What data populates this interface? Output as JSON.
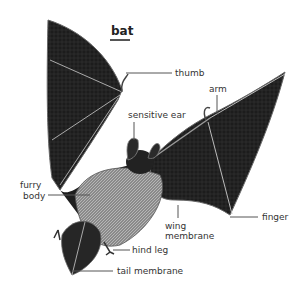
{
  "diagram": {
    "title": "bat",
    "colors": {
      "wing": "#1c1c1c",
      "wing_highlight": "#3a3a3a",
      "body": "#9a9a9a",
      "leader_line": "#555555",
      "label_text": "#333333"
    },
    "labels": {
      "thumb": "thumb",
      "arm": "arm",
      "sensitive_ear": "sensitive ear",
      "furry_body_line1": "furry",
      "furry_body_line2": "body",
      "wing_membrane_line1": "wing",
      "wing_membrane_line2": "membrane",
      "finger": "finger",
      "hind_leg": "hind leg",
      "tail_membrane": "tail membrane"
    }
  }
}
